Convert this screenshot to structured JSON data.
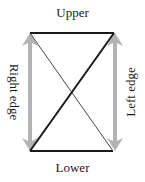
{
  "diagram": {
    "labels": {
      "top": "Upper",
      "bottom": "Lower",
      "left_side": "Right edge",
      "right_side": "Left edge"
    },
    "colors": {
      "edge": "#1a1a1a",
      "arrow": "#b3b3b3",
      "background": "#ffffff"
    },
    "shape": {
      "top_edge": {
        "x1": 30,
        "y1": 33,
        "x2": 114,
        "y2": 33
      },
      "bottom_edge": {
        "x1": 30,
        "y1": 151,
        "x2": 113,
        "y2": 151
      },
      "thick_diagonal": {
        "x1": 114,
        "y1": 33,
        "x2": 30,
        "y2": 151
      },
      "thin_diagonal": {
        "x1": 30,
        "y1": 33,
        "x2": 113,
        "y2": 151
      }
    },
    "arrows": [
      {
        "side": "left",
        "x": 30,
        "y_top": 33,
        "y_bottom": 151,
        "direction": "double"
      },
      {
        "side": "right",
        "x": 115,
        "y_top": 33,
        "y_bottom": 151,
        "direction": "double"
      }
    ]
  }
}
